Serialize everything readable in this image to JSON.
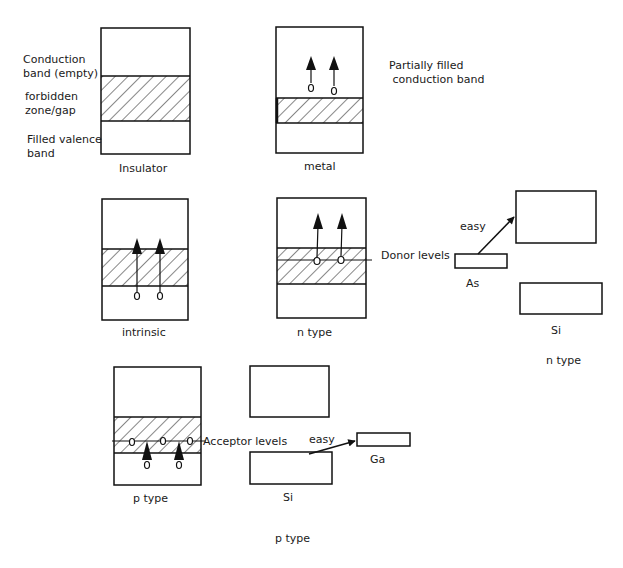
{
  "colors": {
    "stroke": "#111111",
    "background": "#ffffff",
    "text": "#1a1a1a"
  },
  "legend": {
    "conduction_band": "Conduction\nband (empty)",
    "forbidden_zone": "forbidden\nzone/gap",
    "valence_band": "Filled valence\nband"
  },
  "panels": {
    "insulator": {
      "label": "Insulator"
    },
    "metal": {
      "label": "metal",
      "annotation": "Partially filled\n conduction band"
    },
    "intrinsic": {
      "label": "intrinsic"
    },
    "n_type": {
      "label": "n type",
      "level_label": "Donor levels"
    },
    "n_type_detail": {
      "arrow_label": "easy",
      "dopant_label": "As",
      "host_label": "Si",
      "caption": "n type"
    },
    "p_type": {
      "label": "p type",
      "level_label": "Acceptor levels"
    },
    "p_type_detail": {
      "arrow_label": "easy",
      "dopant_label": "Ga",
      "host_label": "Si",
      "caption": "p type"
    }
  }
}
